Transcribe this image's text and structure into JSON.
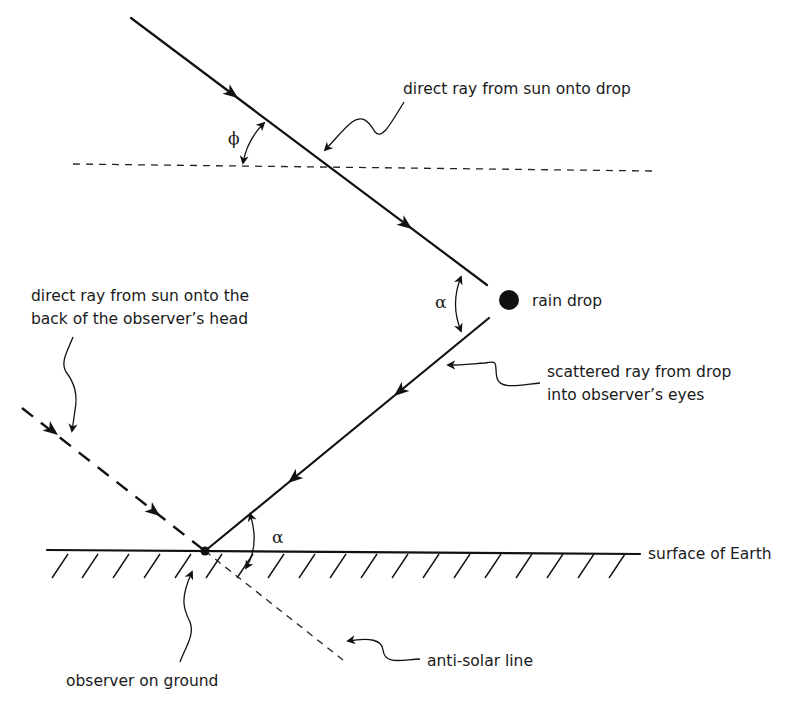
{
  "diagram": {
    "labels": {
      "direct_ray_drop": "direct ray from sun onto drop",
      "rain_drop": "rain drop",
      "direct_ray_head_line1": "direct ray from sun onto the",
      "direct_ray_head_line2": "back of the observer’s head",
      "scattered_ray_line1": "scattered ray from drop",
      "scattered_ray_line2": "into observer’s eyes",
      "surface": "surface of Earth",
      "observer": "observer on ground",
      "anti_solar": "anti-solar line"
    },
    "angles": {
      "phi": "ϕ",
      "alpha_drop": "α",
      "alpha_ground": "α"
    },
    "colors": {
      "ink": "#111111",
      "background": "#ffffff"
    }
  }
}
